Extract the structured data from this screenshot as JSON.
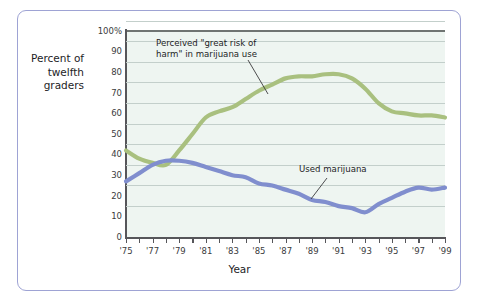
{
  "axis_title_y": "Percent\nof\ntwelfth\ngraders",
  "axis_title_x": "Year",
  "annotations": {
    "green": "Perceived \"great risk of\nharm\" in marijuana use",
    "blue": "Used marijuana"
  },
  "colors": {
    "green_line": "#a9c07f",
    "blue_line": "#808ece",
    "plot_background": "#eef5f1",
    "gridline": "#c3cfcb",
    "axis": "#56565a",
    "frame_border": "#9ea3d4",
    "text": "#1d1d1f"
  },
  "chart_data": {
    "type": "line",
    "title": "",
    "xlabel": "Year",
    "ylabel": "Percent of twelfth graders",
    "xlim": [
      1975,
      1999
    ],
    "ylim": [
      0,
      100
    ],
    "grid": true,
    "legend": "annotations",
    "ytick_labels": [
      "100%",
      "90",
      "80",
      "70",
      "60",
      "50",
      "40",
      "30",
      "20",
      "10",
      "0"
    ],
    "ytick_values": [
      100,
      90,
      80,
      70,
      60,
      50,
      40,
      30,
      20,
      10,
      0
    ],
    "xtick_values": [
      1975,
      1976,
      1977,
      1978,
      1979,
      1980,
      1981,
      1982,
      1983,
      1984,
      1985,
      1986,
      1987,
      1988,
      1989,
      1990,
      1991,
      1992,
      1993,
      1994,
      1995,
      1996,
      1997,
      1998,
      1999
    ],
    "xtick_labels": [
      "'75",
      "",
      "'77",
      "",
      "'79",
      "",
      "'81",
      "",
      "'83",
      "",
      "'85",
      "",
      "'87",
      "",
      "'89",
      "",
      "'91",
      "",
      "'93",
      "",
      "'95",
      "",
      "'97",
      "",
      "'99"
    ],
    "x": [
      1975,
      1976,
      1977,
      1978,
      1979,
      1980,
      1981,
      1982,
      1983,
      1984,
      1985,
      1986,
      1987,
      1988,
      1989,
      1990,
      1991,
      1992,
      1993,
      1994,
      1995,
      1996,
      1997,
      1998,
      1999
    ],
    "series": [
      {
        "name": "Perceived \"great risk of harm\" in marijuana use",
        "color": "#a9c07f",
        "values": [
          42,
          38,
          36,
          35,
          42,
          50,
          58,
          61,
          63,
          67,
          71,
          74,
          77,
          78,
          78,
          79,
          79,
          77,
          72,
          65,
          61,
          60,
          59,
          59,
          58
        ]
      },
      {
        "name": "Used marijuana",
        "color": "#808ece",
        "values": [
          27,
          31,
          35,
          37,
          37,
          36,
          34,
          32,
          30,
          29,
          26,
          25,
          23,
          21,
          18,
          17,
          15,
          14,
          12,
          16,
          19,
          22,
          24,
          23,
          24
        ]
      }
    ]
  }
}
